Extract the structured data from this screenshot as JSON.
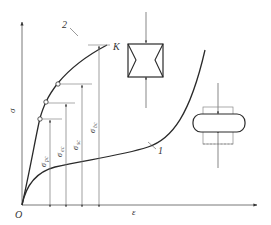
{
  "diagram": {
    "type": "stress-strain compression curves",
    "axes": {
      "origin_label": "O",
      "y_label": "σ",
      "x_label": "ε"
    },
    "curves": [
      {
        "id": "1",
        "label": "1",
        "description": "plastic material compression curve"
      },
      {
        "id": "2",
        "label": "2",
        "description": "brittle material compression curve",
        "end_label": "K"
      }
    ],
    "stress_markers": [
      {
        "label": "σ",
        "sub": "pc"
      },
      {
        "label": "σ",
        "sub": "ec"
      },
      {
        "label": "σ",
        "sub": "sc"
      },
      {
        "label": "σ",
        "sub": "bc"
      }
    ],
    "specimens": [
      {
        "name": "brittle-specimen",
        "description": "hourglass shaped failure under compression"
      },
      {
        "name": "plastic-specimen",
        "description": "flattened specimen under compression"
      }
    ],
    "colors": {
      "line": "#2a2a2a",
      "axis": "#555555",
      "leader": "#888888"
    }
  }
}
